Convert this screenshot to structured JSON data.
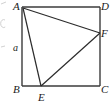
{
  "figure": {
    "type": "geometry-diagram",
    "shape": "square-with-inscribed-triangle",
    "background_color": "#ffffff",
    "stroke_color": "#3b3b3b",
    "inner_stroke_color": "#2b2b2b",
    "label_color": "#1a1a1a",
    "square": {
      "name": "ABCD",
      "vertices": [
        "A",
        "B",
        "C",
        "D"
      ],
      "side_length_label": "a"
    },
    "points_on_sides": [
      {
        "label": "E",
        "on_side": "BC"
      },
      {
        "label": "F",
        "on_side": "DC"
      }
    ],
    "inscribed_triangle": {
      "name": "AEF",
      "vertices": [
        "A",
        "E",
        "F"
      ]
    },
    "geometry": {
      "square": {
        "left": 22,
        "top": 7,
        "right": 100,
        "bottom": 86
      },
      "point_E": {
        "x": 41,
        "y": 86
      },
      "point_F": {
        "x": 100,
        "y": 33
      }
    },
    "labels": {
      "A": {
        "text": "A",
        "x": 13,
        "y": 1
      },
      "D": {
        "text": "D",
        "x": 101,
        "y": 1
      },
      "F": {
        "text": "F",
        "x": 101,
        "y": 28
      },
      "B": {
        "text": "B",
        "x": 13,
        "y": 84
      },
      "C": {
        "text": "C",
        "x": 101,
        "y": 84
      },
      "E": {
        "text": "E",
        "x": 38,
        "y": 92
      },
      "a": {
        "text": "a",
        "x": 13,
        "y": 43
      }
    }
  }
}
